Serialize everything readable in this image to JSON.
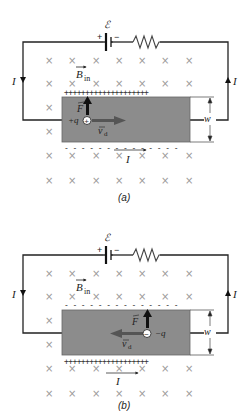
{
  "panels": [
    {
      "caption": "(a)",
      "emf_label": "ℰ",
      "battery_plus": "+",
      "battery_minus": "−",
      "field_label": "B",
      "field_subscript": "in",
      "current_left": "I",
      "current_right": "I",
      "current_bottom": "I",
      "force_label": "F",
      "charge_label": "+q",
      "charge_symbol": "+",
      "drift_label": "v",
      "drift_subscript": "d",
      "width_label": "w",
      "top_edge_charges": "++++++++++++++++++++",
      "bottom_edge_charges": "- - - - - - - - - - - - - -",
      "drift_direction": "right",
      "force_direction": "up"
    },
    {
      "caption": "(b)",
      "emf_label": "ℰ",
      "battery_plus": "+",
      "battery_minus": "−",
      "field_label": "B",
      "field_subscript": "in",
      "current_left": "I",
      "current_right": "I",
      "current_bottom": "I",
      "force_label": "F",
      "charge_label": "−q",
      "charge_symbol": "−",
      "drift_label": "v",
      "drift_subscript": "d",
      "width_label": "w",
      "top_edge_charges": "- - - - - - - - - - - - - -",
      "bottom_edge_charges": "++++++++++++++++++++",
      "drift_direction": "left",
      "force_direction": "up"
    }
  ],
  "field_mark": "×",
  "colors": {
    "conductor": "#8c8c8c",
    "wire": "#222222",
    "field_marks": "#9a9a9a",
    "arrow": "#1a1a1a",
    "drift_arrow": "#555555"
  }
}
